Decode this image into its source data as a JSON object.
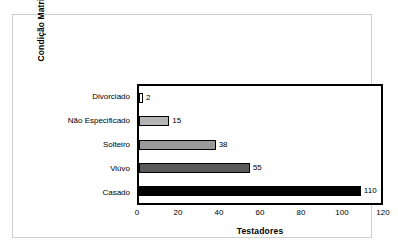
{
  "chart_data": {
    "type": "bar",
    "orientation": "horizontal",
    "title": "",
    "xlabel": "Testadores",
    "ylabel": "Condição Matrimonial",
    "categories": [
      "Divorciado",
      "Não Especificado",
      "Solteiro",
      "Viúvo",
      "Casado"
    ],
    "values": [
      2,
      15,
      38,
      55,
      110
    ],
    "value_labels": [
      "2",
      "15",
      "38",
      "55",
      "110"
    ],
    "bar_colors": [
      "#ffffff",
      "#b5b5b5",
      "#9a9a9a",
      "#5a5a5a",
      "#000000"
    ],
    "bar_edge_color": "#000000",
    "xlim": [
      0,
      120
    ],
    "xticks": [
      0,
      20,
      40,
      60,
      80,
      100,
      120
    ],
    "xtick_labels": [
      "0",
      "20",
      "40",
      "60",
      "80",
      "100",
      "120"
    ],
    "grid": false,
    "legend": false,
    "frame_color": "#000000",
    "outer_border_color": "#cfcfcf"
  },
  "bars": [
    {
      "label": "Divorciado",
      "value_label": "2",
      "width_pct": 1.67,
      "color": "#ffffff"
    },
    {
      "label": "Não Especificado",
      "value_label": "15",
      "width_pct": 12.5,
      "color": "#b5b5b5"
    },
    {
      "label": "Solteiro",
      "value_label": "38",
      "width_pct": 31.67,
      "color": "#9a9a9a"
    },
    {
      "label": "Viúvo",
      "value_label": "55",
      "width_pct": 45.83,
      "color": "#5a5a5a"
    },
    {
      "label": "Casado",
      "value_label": "110",
      "width_pct": 91.67,
      "color": "#000000"
    }
  ],
  "xticks": [
    {
      "label": "0",
      "pos_pct": 0
    },
    {
      "label": "20",
      "pos_pct": 16.667
    },
    {
      "label": "40",
      "pos_pct": 33.333
    },
    {
      "label": "60",
      "pos_pct": 50
    },
    {
      "label": "80",
      "pos_pct": 66.667
    },
    {
      "label": "100",
      "pos_pct": 83.333
    },
    {
      "label": "120",
      "pos_pct": 100
    }
  ],
  "axis_titles": {
    "x": "Testadores",
    "y": "Condição Matrimonial"
  }
}
